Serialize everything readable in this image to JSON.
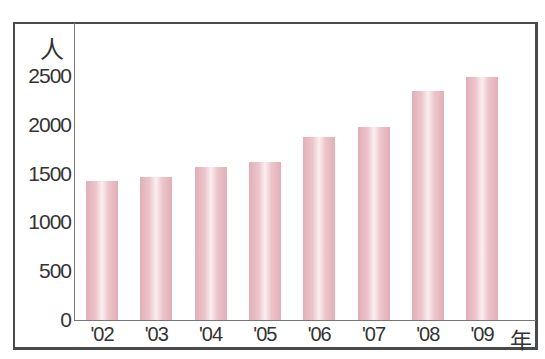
{
  "chart_data": {
    "type": "bar",
    "title": "",
    "xlabel": "年",
    "ylabel": "人",
    "categories": [
      "'02",
      "'03",
      "'04",
      "'05",
      "'06",
      "'07",
      "'08",
      "'09"
    ],
    "values": [
      1420,
      1470,
      1570,
      1620,
      1880,
      1980,
      2350,
      2490
    ],
    "yticks": [
      "0",
      "500",
      "1000",
      "1500",
      "2000",
      "2500"
    ],
    "ylim": [
      0,
      2500
    ],
    "grid": false,
    "legend": null,
    "bar_color": "#e6b8be"
  },
  "labels": {
    "y_unit": "人",
    "x_unit": "年"
  }
}
